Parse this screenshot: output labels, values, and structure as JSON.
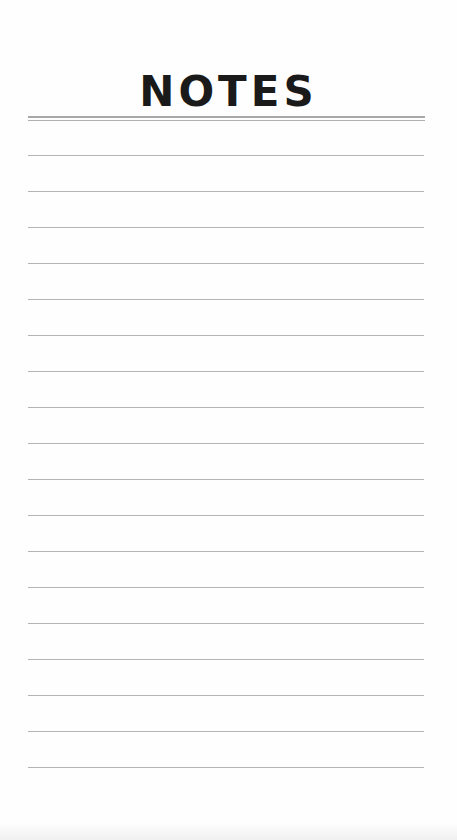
{
  "title": "NOTES",
  "header_rule": {
    "top_y": 116,
    "bottom_y": 120
  },
  "lines": {
    "count": 18,
    "start_y": 155,
    "spacing": 36,
    "color": "#b4b4b4"
  },
  "colors": {
    "title": "#1a1a1a",
    "background": "#fefefe"
  }
}
